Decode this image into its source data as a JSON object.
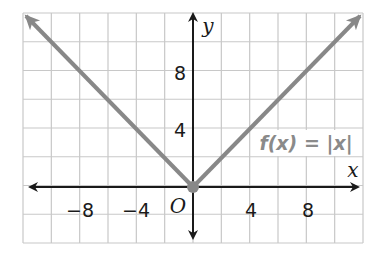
{
  "chart_data": {
    "type": "line",
    "title": "",
    "function_label": "f(x) = |x|",
    "xlabel": "x",
    "ylabel": "y",
    "origin_label": "O",
    "xlim": [
      -12,
      12
    ],
    "ylim": [
      -4,
      12
    ],
    "grid": true,
    "grid_step": 2,
    "x_tick_labels": [
      "−8",
      "−4",
      "4",
      "8"
    ],
    "x_tick_values": [
      -8,
      -4,
      4,
      8
    ],
    "y_tick_labels": [
      "8",
      "4"
    ],
    "y_tick_values": [
      8,
      4
    ],
    "series": [
      {
        "name": "f(x) = |x|",
        "x": [
          -12,
          0,
          12
        ],
        "y": [
          12,
          0,
          12
        ],
        "color": "#888888"
      }
    ],
    "vertex": {
      "x": 0,
      "y": 0
    }
  },
  "colors": {
    "grid": "#c8c8c8",
    "axis": "#1a1a1a",
    "curve": "#888888"
  }
}
